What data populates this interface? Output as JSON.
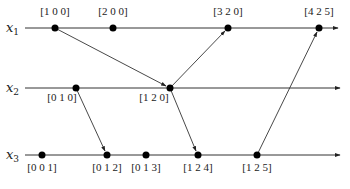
{
  "diagram": {
    "type": "vector-clock-space-time",
    "processes": [
      {
        "id": "x1",
        "label": "x",
        "sub": "1",
        "y": 28
      },
      {
        "id": "x2",
        "label": "x",
        "sub": "2",
        "y": 88
      },
      {
        "id": "x3",
        "label": "x",
        "sub": "3",
        "y": 155
      }
    ],
    "events": [
      {
        "id": "e100",
        "process": "x1",
        "x": 55,
        "label": "[1 0 0]",
        "label_pos": "above"
      },
      {
        "id": "e200",
        "process": "x1",
        "x": 113,
        "label": "[2 0 0]",
        "label_pos": "above"
      },
      {
        "id": "e320",
        "process": "x1",
        "x": 228,
        "label": "[3 2 0]",
        "label_pos": "above"
      },
      {
        "id": "e425",
        "process": "x1",
        "x": 319,
        "label": "[4 2 5]",
        "label_pos": "above"
      },
      {
        "id": "e010",
        "process": "x2",
        "x": 76,
        "label": "[0 1 0]",
        "label_pos": "below-left"
      },
      {
        "id": "e120",
        "process": "x2",
        "x": 170,
        "label": "[1 2 0]",
        "label_pos": "below-left"
      },
      {
        "id": "e001",
        "process": "x3",
        "x": 42,
        "label": "[0 0 1]",
        "label_pos": "below"
      },
      {
        "id": "e012",
        "process": "x3",
        "x": 107,
        "label": "[0 1 2]",
        "label_pos": "below"
      },
      {
        "id": "e013",
        "process": "x3",
        "x": 146,
        "label": "[0 1 3]",
        "label_pos": "below"
      },
      {
        "id": "e124",
        "process": "x3",
        "x": 198,
        "label": "[1 2 4]",
        "label_pos": "below"
      },
      {
        "id": "e125",
        "process": "x3",
        "x": 257,
        "label": "[1 2 5]",
        "label_pos": "below"
      }
    ],
    "messages": [
      {
        "from": "e100",
        "to": "e120"
      },
      {
        "from": "e120",
        "to": "e320"
      },
      {
        "from": "e010",
        "to": "e012"
      },
      {
        "from": "e120",
        "to": "e124"
      },
      {
        "from": "e125",
        "to": "e425"
      }
    ],
    "colors": {
      "line": "#333333",
      "event": "#000000",
      "text": "#222222",
      "background": "#ffffff"
    }
  }
}
